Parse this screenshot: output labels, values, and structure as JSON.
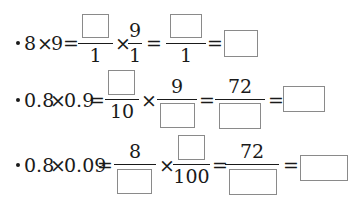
{
  "worksheet": {
    "rows": [
      {
        "expression": "8×9",
        "lhs_a": "8",
        "op": "×",
        "lhs_b": "9",
        "eq": "=",
        "frac1": {
          "numerator": "",
          "denominator": "1"
        },
        "times": "×",
        "frac2": {
          "numerator": "9",
          "denominator": "1"
        },
        "frac3": {
          "numerator": "",
          "denominator": "1"
        },
        "answer": ""
      },
      {
        "expression": "0.8×0.9",
        "lhs_a": "0.8",
        "op": "×",
        "lhs_b": "0.9",
        "eq": "=",
        "frac1": {
          "numerator": "",
          "denominator": "10"
        },
        "times": "×",
        "frac2": {
          "numerator": "9",
          "denominator": ""
        },
        "frac3": {
          "numerator": "72",
          "denominator": ""
        },
        "answer": ""
      },
      {
        "expression": "0.8×0.09",
        "lhs_a": "0.8",
        "op": "×",
        "lhs_b": "0.09",
        "eq": "=",
        "frac1": {
          "numerator": "8",
          "denominator": ""
        },
        "times": "×",
        "frac2": {
          "numerator": "",
          "denominator": "100"
        },
        "frac3": {
          "numerator": "72",
          "denominator": ""
        },
        "answer": ""
      }
    ]
  }
}
